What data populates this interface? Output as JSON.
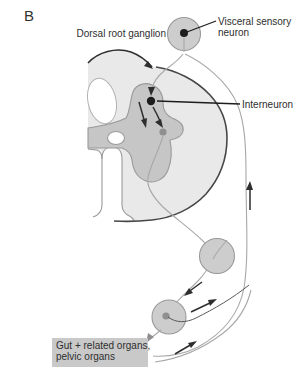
{
  "figure": {
    "panel_label": "B",
    "labels": {
      "dorsal_root_ganglion": "Dorsal root ganglion",
      "visceral_sensory_line1": "Visceral sensory",
      "visceral_sensory_line2": "neuron",
      "interneuron": "Interneuron",
      "organs_line1": "Gut + related organs,",
      "organs_line2": "pelvic organs"
    },
    "colors": {
      "white_matter": "#e9e9e9",
      "gray_matter": "#c6c6c6",
      "ganglion_fill": "#cdcdcd",
      "organ_box_fill": "#c9c9c9",
      "neuron_soma_black": "#1d1d1d",
      "neuron_soma_gray": "#8f8f8f",
      "axon_gray": "#a8a8a8"
    }
  }
}
